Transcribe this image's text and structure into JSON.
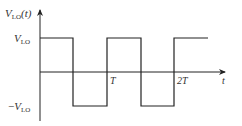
{
  "diagram": {
    "type": "square-wave",
    "y_axis_label": {
      "main": "V",
      "sub": "LO",
      "suffix": "(t)"
    },
    "x_axis_label": "t",
    "levels": {
      "high": {
        "main": "V",
        "sub": "LO"
      },
      "low": {
        "prefix": "−",
        "main": "V",
        "sub": "LO"
      }
    },
    "x_ticks": [
      "T",
      "2T"
    ],
    "colors": {
      "line": "#222222",
      "text": "#333333",
      "background": "#ffffff"
    }
  }
}
